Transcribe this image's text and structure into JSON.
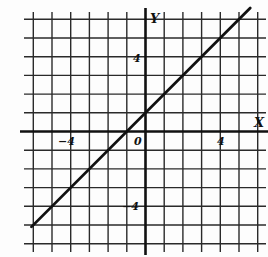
{
  "chart_data": {
    "type": "line",
    "title": "",
    "xlabel": "X",
    "ylabel": "Y",
    "xlim": [
      -6,
      6
    ],
    "ylim": [
      -6,
      6
    ],
    "grid": true,
    "grid_step": 1,
    "tick_labels": {
      "x": [
        {
          "value": -4,
          "label": "−4"
        },
        {
          "value": 0,
          "label": "0"
        },
        {
          "value": 4,
          "label": "4"
        }
      ],
      "y": [
        {
          "value": 4,
          "label": "4"
        },
        {
          "value": -4,
          "label": "−4"
        }
      ]
    },
    "series": [
      {
        "name": "y = x + 1",
        "equation": "y = x + 1",
        "x": [
          -6.1,
          5.6
        ],
        "y": [
          -5.1,
          6.6
        ],
        "color": "#111111"
      }
    ],
    "legend": null
  },
  "labels": {
    "x_axis": "X",
    "y_axis": "Y",
    "origin": "0",
    "x_neg4": "−4",
    "x_pos4": "4",
    "y_pos4": "4",
    "y_neg4": "−4"
  },
  "colors": {
    "grid": "#2a2a2a",
    "axis": "#111111",
    "line": "#111111",
    "background": "#fdfdfd"
  }
}
